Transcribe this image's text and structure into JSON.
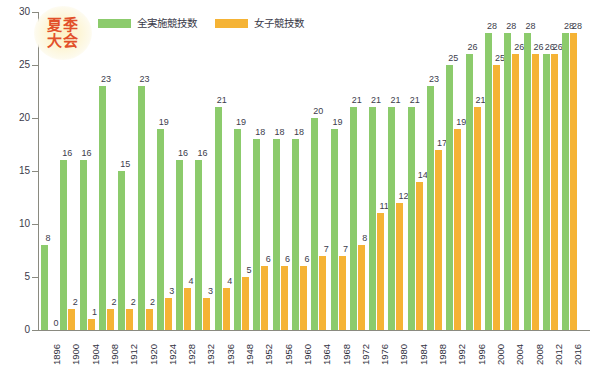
{
  "badge": {
    "line1": "夏季",
    "line2": "大会",
    "color": "#e2502a"
  },
  "legend": {
    "position": "top-left",
    "items": [
      {
        "label": "全実施競技数",
        "color": "#8ccb6c",
        "name": "total-events"
      },
      {
        "label": "女子競技数",
        "color": "#f5b335",
        "name": "womens-events"
      }
    ]
  },
  "axis": {
    "y_ticks": [
      "0",
      "5",
      "10",
      "15",
      "20",
      "25",
      "30"
    ],
    "y_min": 0,
    "y_max": 30
  },
  "chart_data": {
    "type": "bar",
    "xlabel": "",
    "ylabel": "",
    "ylim": [
      0,
      30
    ],
    "ytick_step": 5,
    "grid": false,
    "legend_position": "top-left",
    "categories": [
      "1896",
      "1900",
      "1904",
      "1908",
      "1912",
      "1920",
      "1924",
      "1928",
      "1932",
      "1936",
      "1948",
      "1952",
      "1956",
      "1960",
      "1964",
      "1968",
      "1972",
      "1976",
      "1980",
      "1984",
      "1988",
      "1992",
      "1996",
      "2000",
      "2004",
      "2008",
      "2012",
      "2016"
    ],
    "series": [
      {
        "name": "全実施競技数",
        "color": "#8ccb6c",
        "values": [
          8,
          16,
          16,
          23,
          15,
          23,
          19,
          16,
          16,
          21,
          19,
          18,
          18,
          18,
          20,
          19,
          21,
          21,
          21,
          21,
          23,
          25,
          26,
          28,
          28,
          28,
          26,
          28
        ]
      },
      {
        "name": "女子競技数",
        "color": "#f5b335",
        "values": [
          0,
          2,
          1,
          2,
          2,
          2,
          3,
          4,
          3,
          4,
          5,
          6,
          6,
          6,
          7,
          7,
          8,
          11,
          12,
          14,
          17,
          19,
          21,
          25,
          26,
          26,
          26,
          28
        ]
      }
    ]
  }
}
